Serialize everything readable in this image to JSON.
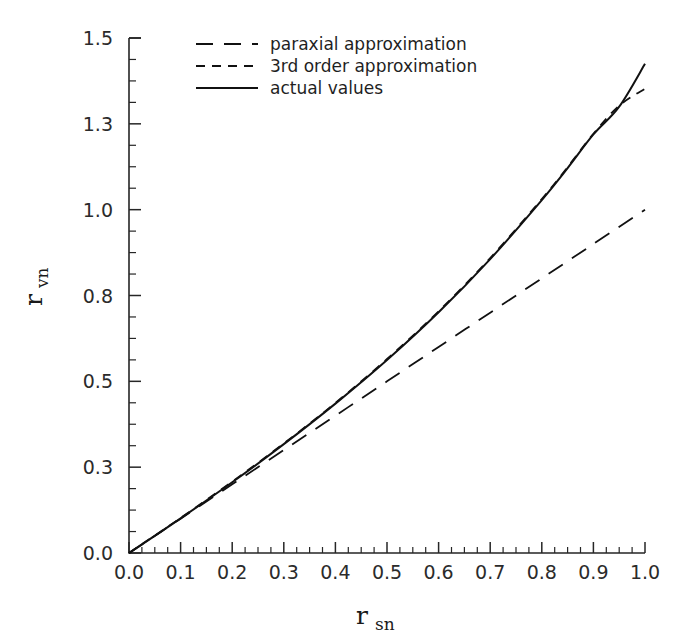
{
  "chart_data": {
    "type": "line",
    "title": "",
    "xlabel": "r_sn",
    "ylabel": "r_vn",
    "xlabel_base": "r",
    "xlabel_sub": "sn",
    "ylabel_base": "r",
    "ylabel_sub": "vn",
    "xlim": [
      0.0,
      1.0
    ],
    "ylim": [
      0.0,
      1.5
    ],
    "grid": false,
    "legend_position": "top-center",
    "xticks": [
      0.0,
      0.1,
      0.2,
      0.3,
      0.4,
      0.5,
      0.6,
      0.7,
      0.8,
      0.9,
      1.0
    ],
    "xticklabels": [
      "0.0",
      "0.1",
      "0.2",
      "0.3",
      "0.4",
      "0.5",
      "0.6",
      "0.7",
      "0.8",
      "0.9",
      "1.0"
    ],
    "x_minor_tick_step": 0.025,
    "yticks": [
      0.0,
      0.25,
      0.5,
      0.75,
      1.0,
      1.25,
      1.5
    ],
    "yticklabels": [
      "0.0",
      "0.3",
      "0.5",
      "0.8",
      "1.0",
      "1.3",
      "1.5"
    ],
    "y_minor_tick_step": 0.0625,
    "series": [
      {
        "name": "paraxial approximation",
        "style": "long-dash",
        "color": "#111111",
        "x": [
          0.0,
          0.1,
          0.2,
          0.3,
          0.4,
          0.5,
          0.6,
          0.7,
          0.8,
          0.9,
          1.0
        ],
        "values": [
          0.0,
          0.1,
          0.2,
          0.3,
          0.4,
          0.5,
          0.6,
          0.7,
          0.8,
          0.9,
          1.0
        ]
      },
      {
        "name": "3rd order approximation",
        "style": "short-dash",
        "color": "#111111",
        "x": [
          0.0,
          0.1,
          0.2,
          0.3,
          0.4,
          0.5,
          0.6,
          0.7,
          0.8,
          0.85,
          0.9,
          0.95,
          1.0
        ],
        "values": [
          0.0,
          0.102,
          0.208,
          0.319,
          0.437,
          0.565,
          0.704,
          0.859,
          1.031,
          1.124,
          1.221,
          1.303,
          1.352
        ]
      },
      {
        "name": "actual values",
        "style": "solid",
        "color": "#111111",
        "x": [
          0.0,
          0.1,
          0.2,
          0.3,
          0.4,
          0.5,
          0.6,
          0.7,
          0.8,
          0.85,
          0.9,
          0.95,
          1.0
        ],
        "values": [
          0.0,
          0.101,
          0.206,
          0.317,
          0.435,
          0.562,
          0.701,
          0.856,
          1.028,
          1.121,
          1.219,
          1.3,
          1.425
        ]
      }
    ]
  },
  "legend": {
    "entries": [
      {
        "label": "paraxial approximation",
        "style": "long-dash"
      },
      {
        "label": "3rd order approximation",
        "style": "short-dash"
      },
      {
        "label": "actual values",
        "style": "solid"
      }
    ]
  },
  "colors": {
    "ink": "#111111",
    "axis": "#262626",
    "background": "#ffffff"
  }
}
